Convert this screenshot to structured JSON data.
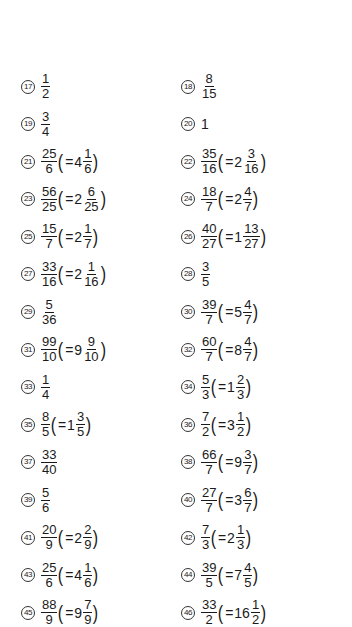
{
  "answers": [
    [
      {
        "num": "17",
        "n": "1",
        "d": "2"
      },
      {
        "num": "18",
        "n": "8",
        "d": "15"
      }
    ],
    [
      {
        "num": "19",
        "n": "3",
        "d": "4"
      },
      {
        "num": "20",
        "whole": "1"
      }
    ],
    [
      {
        "num": "21",
        "n": "25",
        "d": "6",
        "mw": "4",
        "mn": "1",
        "md": "6"
      },
      {
        "num": "22",
        "n": "35",
        "d": "16",
        "mw": "2",
        "mn": "3",
        "md": "16"
      }
    ],
    [
      {
        "num": "23",
        "n": "56",
        "d": "25",
        "mw": "2",
        "mn": "6",
        "md": "25"
      },
      {
        "num": "24",
        "n": "18",
        "d": "7",
        "mw": "2",
        "mn": "4",
        "md": "7"
      }
    ],
    [
      {
        "num": "25",
        "n": "15",
        "d": "7",
        "mw": "2",
        "mn": "1",
        "md": "7"
      },
      {
        "num": "26",
        "n": "40",
        "d": "27",
        "mw": "1",
        "mn": "13",
        "md": "27"
      }
    ],
    [
      {
        "num": "27",
        "n": "33",
        "d": "16",
        "mw": "2",
        "mn": "1",
        "md": "16"
      },
      {
        "num": "28",
        "n": "3",
        "d": "5"
      }
    ],
    [
      {
        "num": "29",
        "n": "5",
        "d": "36"
      },
      {
        "num": "30",
        "n": "39",
        "d": "7",
        "mw": "5",
        "mn": "4",
        "md": "7"
      }
    ],
    [
      {
        "num": "31",
        "n": "99",
        "d": "10",
        "mw": "9",
        "mn": "9",
        "md": "10"
      },
      {
        "num": "32",
        "n": "60",
        "d": "7",
        "mw": "8",
        "mn": "4",
        "md": "7"
      }
    ],
    [
      {
        "num": "33",
        "n": "1",
        "d": "4"
      },
      {
        "num": "34",
        "n": "5",
        "d": "3",
        "mw": "1",
        "mn": "2",
        "md": "3"
      }
    ],
    [
      {
        "num": "35",
        "n": "8",
        "d": "5",
        "mw": "1",
        "mn": "3",
        "md": "5"
      },
      {
        "num": "36",
        "n": "7",
        "d": "2",
        "mw": "3",
        "mn": "1",
        "md": "2"
      }
    ],
    [
      {
        "num": "37",
        "n": "33",
        "d": "40"
      },
      {
        "num": "38",
        "n": "66",
        "d": "7",
        "mw": "9",
        "mn": "3",
        "md": "7"
      }
    ],
    [
      {
        "num": "39",
        "n": "5",
        "d": "6"
      },
      {
        "num": "40",
        "n": "27",
        "d": "7",
        "mw": "3",
        "mn": "6",
        "md": "7"
      }
    ],
    [
      {
        "num": "41",
        "n": "20",
        "d": "9",
        "mw": "2",
        "mn": "2",
        "md": "9"
      },
      {
        "num": "42",
        "n": "7",
        "d": "3",
        "mw": "2",
        "mn": "1",
        "md": "3"
      }
    ],
    [
      {
        "num": "43",
        "n": "25",
        "d": "6",
        "mw": "4",
        "mn": "1",
        "md": "6"
      },
      {
        "num": "44",
        "n": "39",
        "d": "5",
        "mw": "7",
        "mn": "4",
        "md": "5"
      }
    ],
    [
      {
        "num": "45",
        "n": "88",
        "d": "9",
        "mw": "9",
        "mn": "7",
        "md": "9"
      },
      {
        "num": "46",
        "n": "33",
        "d": "2",
        "mw": "16",
        "mn": "1",
        "md": "2"
      }
    ]
  ],
  "symbols": {
    "open": "(",
    "close": ")",
    "equals": "="
  }
}
